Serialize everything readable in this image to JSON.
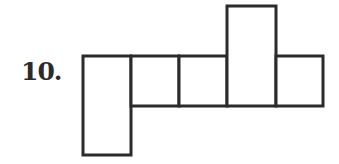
{
  "problem": {
    "number_label": "10."
  },
  "figure": {
    "stroke_color": "#2b2b2b",
    "cells": [
      {
        "id": "left-tall",
        "x": 82,
        "y": 56,
        "w": 49,
        "h": 100
      },
      {
        "id": "square-1",
        "x": 131,
        "y": 56,
        "w": 48,
        "h": 50
      },
      {
        "id": "square-2",
        "x": 179,
        "y": 56,
        "w": 48,
        "h": 50
      },
      {
        "id": "top-tall",
        "x": 227,
        "y": 5,
        "w": 49,
        "h": 101
      },
      {
        "id": "square-4",
        "x": 276,
        "y": 56,
        "w": 48,
        "h": 50
      }
    ]
  }
}
